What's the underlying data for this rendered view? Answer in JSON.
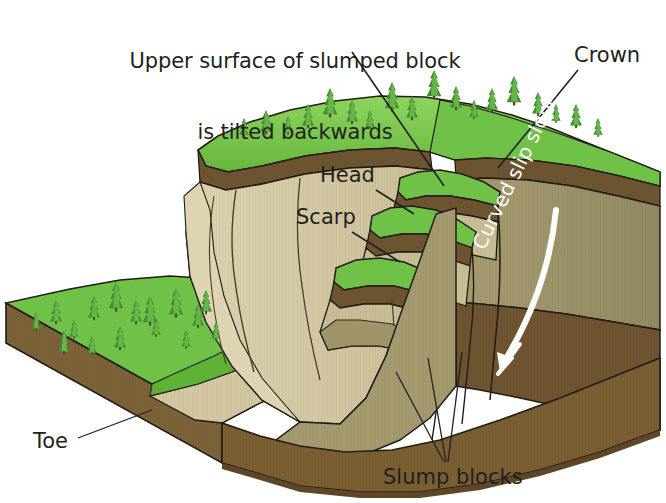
{
  "figure": {
    "title_line1": "Upper surface of slumped block",
    "title_line2": "is tilted backwards"
  },
  "labels": {
    "crown": "Crown",
    "head": "Head",
    "scarp": "Scarp",
    "toe": "Toe",
    "slump_blocks": "Slump blocks",
    "curved_slip_slope": "Curved slip slope"
  },
  "colors": {
    "grass_top": "#6fc247",
    "grass_light": "#8ed45f",
    "grass_dark": "#4f9e31",
    "topsoil_brown": "#6d5430",
    "scarp_tan": "#d3c7a2",
    "scarp_tan_light": "#ddd3b2",
    "subsoil_khaki": "#9c9165",
    "block_side_brown": "#6e5430",
    "block_front_brown": "#7b6238",
    "outline": "#221c14",
    "text": "#231f20",
    "arrow_white": "#ffffff",
    "background": "#ffffff"
  },
  "features": {
    "slump_block_count": 3,
    "tree_type": "conifer",
    "arrow_direction": "down-left curved"
  }
}
